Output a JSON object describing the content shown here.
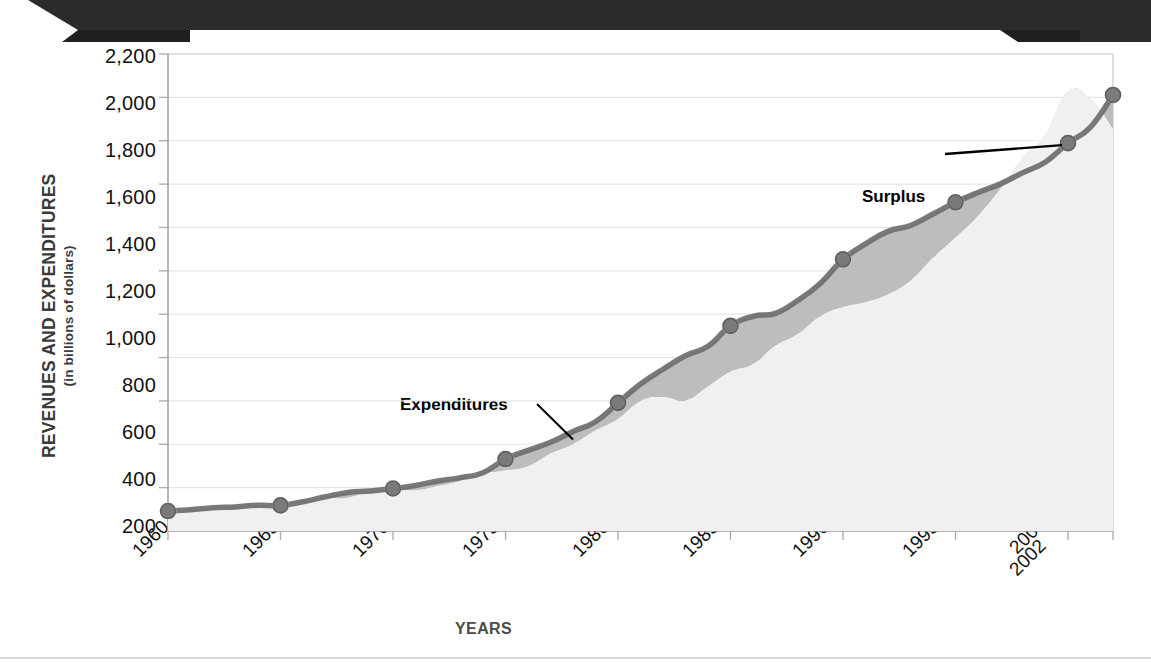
{
  "banner": {
    "title": "",
    "icon": "ribbon-banner",
    "color": "#2b2b2b"
  },
  "chart_data": {
    "type": "area",
    "title": "",
    "xlabel": "YEARS",
    "ylabel": "REVENUES AND EXPENDITURES",
    "ylabel_sub": "(in billions of dollars)",
    "ylim": [
      0,
      2200
    ],
    "xlim": [
      1960,
      2002
    ],
    "grid": true,
    "legend_position": "inline-annotations",
    "ytick_labels": [
      "2,200",
      "2,000",
      "1,800",
      "1,600",
      "1,400",
      "1,200",
      "1,000",
      "800",
      "600",
      "400",
      "200"
    ],
    "ytick_values": [
      2200,
      2000,
      1800,
      1600,
      1400,
      1200,
      1000,
      800,
      600,
      400,
      200
    ],
    "xtick_labels": [
      "1960",
      "1965",
      "1970",
      "1975",
      "1980",
      "1985",
      "1990",
      "1995",
      "2000",
      "2002"
    ],
    "xtick_values": [
      1960,
      1965,
      1970,
      1975,
      1980,
      1985,
      1990,
      1995,
      2000,
      2002
    ],
    "annotations": [
      {
        "name": "expenditures-label",
        "text": "Expenditures",
        "leader": true
      },
      {
        "name": "deficit-label",
        "text": "Deficit",
        "leader": false
      },
      {
        "name": "revenues-label",
        "text": "Revenues",
        "leader": false
      },
      {
        "name": "surplus-label",
        "text": "Surplus",
        "leader": true
      }
    ],
    "colors": {
      "revenues_fill": "#f0f0f0",
      "deficit_fill": "#bdbdbd",
      "expenditures_line": "#6e6e6e",
      "marker": "#7a7a7a",
      "axis": "#9a9a9a"
    },
    "x": [
      1960,
      1961,
      1962,
      1963,
      1964,
      1965,
      1966,
      1967,
      1968,
      1969,
      1970,
      1971,
      1972,
      1973,
      1974,
      1975,
      1976,
      1977,
      1978,
      1979,
      1980,
      1981,
      1982,
      1983,
      1984,
      1985,
      1986,
      1987,
      1988,
      1989,
      1990,
      1991,
      1992,
      1993,
      1994,
      1995,
      1996,
      1997,
      1998,
      1999,
      2000,
      2001,
      2002
    ],
    "series": [
      {
        "name": "Expenditures",
        "marker_years": [
          1960,
          1965,
          1970,
          1975,
          1980,
          1985,
          1990,
          1995,
          2000,
          2002
        ],
        "values": [
          92,
          98,
          107,
          111,
          119,
          118,
          135,
          158,
          178,
          184,
          196,
          210,
          231,
          246,
          269,
          332,
          372,
          409,
          459,
          504,
          591,
          678,
          746,
          808,
          852,
          946,
          990,
          1004,
          1064,
          1143,
          1253,
          1324,
          1382,
          1409,
          1462,
          1516,
          1561,
          1601,
          1653,
          1702,
          1789,
          1863,
          2011
        ]
      },
      {
        "name": "Revenues",
        "values": [
          92,
          94,
          100,
          107,
          113,
          117,
          131,
          149,
          153,
          187,
          193,
          187,
          207,
          231,
          263,
          279,
          298,
          356,
          400,
          463,
          517,
          599,
          618,
          601,
          666,
          734,
          769,
          854,
          909,
          991,
          1032,
          1055,
          1091,
          1154,
          1259,
          1352,
          1453,
          1579,
          1722,
          1827,
          2025,
          1991,
          1853
        ]
      }
    ]
  }
}
